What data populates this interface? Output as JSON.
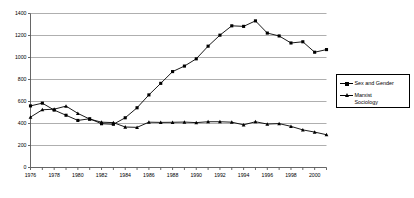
{
  "chart_data": {
    "type": "line",
    "title": "",
    "subtitle": "",
    "xlabel": "",
    "ylabel": "",
    "xlim": [
      1976,
      2001
    ],
    "ylim": [
      0,
      1400
    ],
    "yticks": [
      0,
      200,
      400,
      600,
      800,
      1000,
      1200,
      1400
    ],
    "ytick_labels": [
      "0",
      "200",
      "400",
      "600",
      "800",
      "1000",
      "1200",
      "1400"
    ],
    "xticks": [
      1976,
      1978,
      1980,
      1982,
      1984,
      1986,
      1988,
      1990,
      1992,
      1994,
      1996,
      1998,
      2000
    ],
    "xtick_labels": [
      "1976",
      "1978",
      "1980",
      "1982",
      "1984",
      "1986",
      "1988",
      "1990",
      "1992",
      "1994",
      "1996",
      "1998",
      "2000"
    ],
    "x": [
      1976,
      1977,
      1978,
      1979,
      1980,
      1981,
      1982,
      1983,
      1984,
      1985,
      1986,
      1987,
      1988,
      1989,
      1990,
      1991,
      1992,
      1993,
      1994,
      1995,
      1996,
      1997,
      1998,
      1999,
      2000,
      2001
    ],
    "grid": "horizontal",
    "legend_position": "right",
    "series": [
      {
        "name": "Sex and Gender",
        "marker": "square",
        "color": "#000000",
        "values": [
          560,
          585,
          522,
          475,
          428,
          443,
          398,
          393,
          452,
          543,
          660,
          765,
          872,
          922,
          988,
          1103,
          1203,
          1288,
          1283,
          1333,
          1222,
          1196,
          1132,
          1143,
          1048,
          1072
        ]
      },
      {
        "name": "Marxist Sociology",
        "marker": "triangle",
        "color": "#000000",
        "values": [
          458,
          525,
          530,
          558,
          492,
          440,
          412,
          408,
          368,
          365,
          412,
          410,
          411,
          413,
          408,
          416,
          416,
          412,
          388,
          416,
          395,
          399,
          374,
          342,
          322,
          298
        ]
      }
    ]
  },
  "legend": {
    "entries": [
      {
        "label": "Sex and Gender"
      },
      {
        "label": "Marxist\nSociology"
      }
    ]
  }
}
